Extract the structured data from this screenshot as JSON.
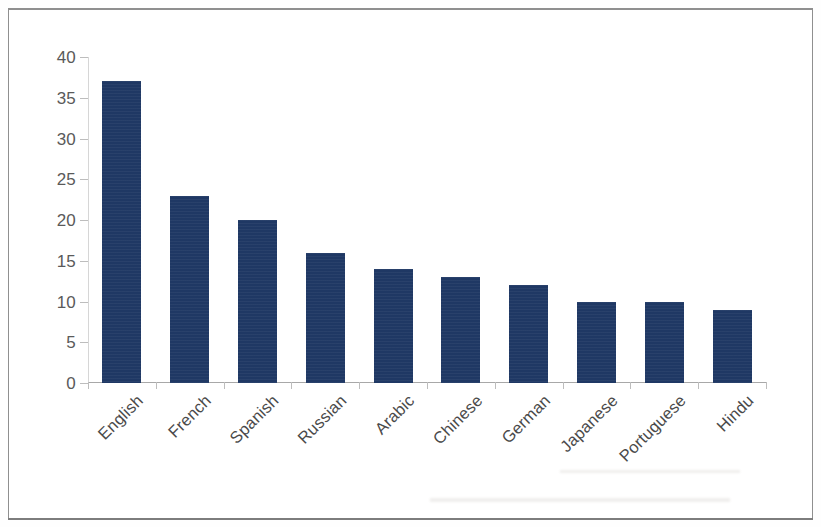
{
  "chart_data": {
    "type": "bar",
    "title": "",
    "subtitle": "",
    "xlabel": "",
    "ylabel": "",
    "categories": [
      "English",
      "French",
      "Spanish",
      "Russian",
      "Arabic",
      "Chinese",
      "German",
      "Japanese",
      "Portuguese",
      "Hindu"
    ],
    "values": [
      37,
      23,
      20,
      16,
      14,
      13,
      12,
      10,
      10,
      9
    ],
    "series": [
      {
        "name": "",
        "values": [
          37,
          23,
          20,
          16,
          14,
          13,
          12,
          10,
          10,
          9
        ]
      }
    ],
    "ylim": [
      0,
      40
    ],
    "ytick_labels": [
      "0",
      "5",
      "10",
      "15",
      "20",
      "25",
      "30",
      "35",
      "40"
    ],
    "ytick_values": [
      0,
      5,
      10,
      15,
      20,
      25,
      30,
      35,
      40
    ],
    "grid": false,
    "legend": "none",
    "bar_color": "#1F3864",
    "axis_color": "#A8A8A8",
    "tick_label_color": "#5A5A5A",
    "category_label_color": "#4A4A4A",
    "category_label_rotation": "-45",
    "background_color": "#FFFFFF",
    "border_color": "#8F8F8F"
  }
}
